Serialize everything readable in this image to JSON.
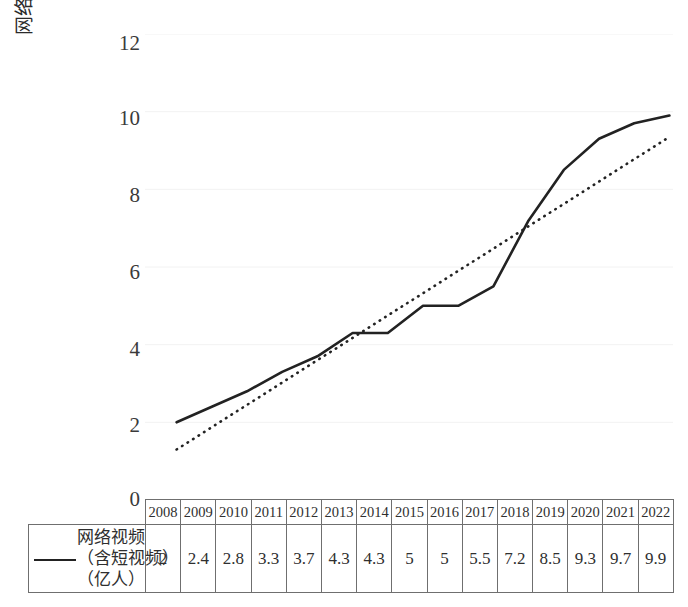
{
  "chart_data": {
    "type": "line",
    "title": "",
    "subtitle": "",
    "xlabel": "",
    "ylabel": "网络视频（含短视频）用户（亿人）",
    "categories": [
      "2008",
      "2009",
      "2010",
      "2011",
      "2012",
      "2013",
      "2014",
      "2015",
      "2016",
      "2017",
      "2018",
      "2019",
      "2020",
      "2021",
      "2022"
    ],
    "ylim": [
      0,
      12
    ],
    "yticks": [
      0,
      2,
      4,
      6,
      8,
      10,
      12
    ],
    "grid": true,
    "legend_position": "table-left",
    "series": [
      {
        "name": "网络视频（含短视频）（亿人）",
        "style": "solid",
        "color": "#222222",
        "values": [
          2,
          2.4,
          2.8,
          3.3,
          3.7,
          4.3,
          4.3,
          5,
          5,
          5.5,
          7.2,
          8.5,
          9.3,
          9.7,
          9.9
        ]
      },
      {
        "name": "线性趋势线",
        "style": "dotted",
        "color": "#222222",
        "values": [
          1.3,
          1.875,
          2.45,
          3.025,
          3.6,
          4.175,
          4.75,
          5.325,
          5.9,
          6.475,
          7.05,
          7.625,
          8.2,
          8.775,
          9.35
        ]
      }
    ]
  },
  "axis": {
    "y_title": "网络视频（含短视频）用户（亿人）",
    "y_tick_labels": [
      "12",
      "10",
      "8",
      "6",
      "4",
      "2",
      "0"
    ]
  },
  "table": {
    "legend_label_lines": [
      "网络视频",
      "（含短视频）",
      "（亿人）"
    ],
    "legend_label": "网络视频（含短视频）（亿人）",
    "headers": [
      "2008",
      "2009",
      "2010",
      "2011",
      "2012",
      "2013",
      "2014",
      "2015",
      "2016",
      "2017",
      "2018",
      "2019",
      "2020",
      "2021",
      "2022"
    ],
    "values": [
      "2",
      "2.4",
      "2.8",
      "3.3",
      "3.7",
      "4.3",
      "4.3",
      "5",
      "5",
      "5.5",
      "7.2",
      "8.5",
      "9.3",
      "9.7",
      "9.9"
    ]
  },
  "colors": {
    "line": "#222222",
    "trendline": "#222222",
    "grid": "#f2f2f2",
    "border": "#6f6f6f",
    "text": "#2b2b2b"
  }
}
